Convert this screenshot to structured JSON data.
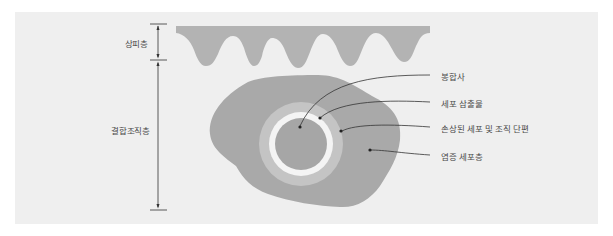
{
  "diagram": {
    "layers": {
      "epidermis": "상피층",
      "connective_tissue": "결합조직층"
    },
    "callouts": [
      {
        "id": "suture",
        "label": "봉합사"
      },
      {
        "id": "cell_exudate",
        "label": "세포 삼출물"
      },
      {
        "id": "damaged_section",
        "label": "손상된 세포 및 조직 단편"
      },
      {
        "id": "inflammatory_layer",
        "label": "염증 세포층"
      }
    ],
    "colors": {
      "background": "#efefef",
      "epidermis": "#b3b3b3",
      "blob": "#a9a9a9",
      "outer_ring": "#c4c4c4",
      "white_ring": "#f4f4f4",
      "core": "#a6a6a6",
      "line": "#333333",
      "text": "#4a4a4a"
    }
  }
}
